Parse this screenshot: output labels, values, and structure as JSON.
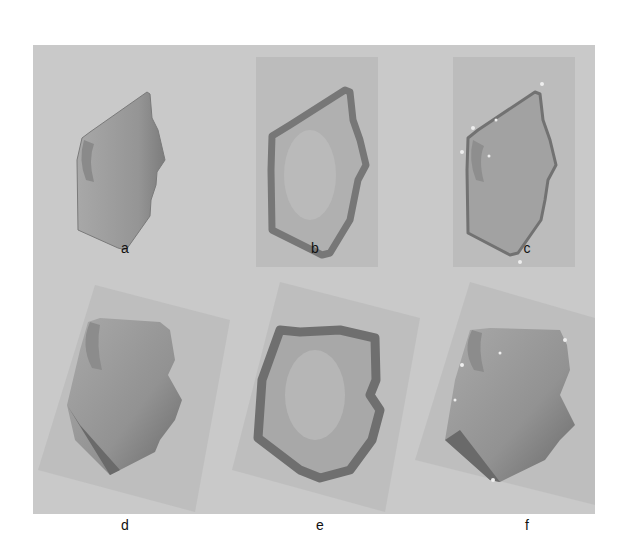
{
  "figure": {
    "background_color": "#c9c9c9",
    "inner_rect_color": "#bcbcbc",
    "face_color": "#9c9c9c",
    "face_edge_color": "#6e6e6e",
    "landmark_color": "#eeeeee",
    "panels": [
      {
        "id": "a",
        "label": "a",
        "description": "3D face scan, profile view, cropped"
      },
      {
        "id": "b",
        "label": "b",
        "description": "3D face scan with noisy edges on rectangle background"
      },
      {
        "id": "c",
        "label": "c",
        "description": "3D face scan with outline and landmark points"
      },
      {
        "id": "d",
        "label": "d",
        "description": "Rotated 3D face scan, profile view"
      },
      {
        "id": "e",
        "label": "e",
        "description": "Rotated 3D face scan with noisy edges"
      },
      {
        "id": "f",
        "label": "f",
        "description": "Rotated 3D face scan with landmark points"
      }
    ]
  }
}
